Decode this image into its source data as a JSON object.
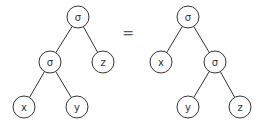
{
  "diagram": {
    "relation": "=",
    "left_tree": {
      "nodes": [
        {
          "id": "root",
          "label": "σ",
          "x": 78,
          "y": 17
        },
        {
          "id": "inner",
          "label": "σ",
          "x": 50,
          "y": 62
        },
        {
          "id": "z",
          "label": "z",
          "x": 103,
          "y": 62
        },
        {
          "id": "x",
          "label": "x",
          "x": 24,
          "y": 107
        },
        {
          "id": "y",
          "label": "y",
          "x": 77,
          "y": 107
        }
      ],
      "edges": [
        [
          "root",
          "inner"
        ],
        [
          "root",
          "z"
        ],
        [
          "inner",
          "x"
        ],
        [
          "inner",
          "y"
        ]
      ]
    },
    "right_tree": {
      "nodes": [
        {
          "id": "root",
          "label": "σ",
          "x": 188,
          "y": 17
        },
        {
          "id": "x",
          "label": "x",
          "x": 161,
          "y": 62
        },
        {
          "id": "inner",
          "label": "σ",
          "x": 215,
          "y": 62
        },
        {
          "id": "y",
          "label": "y",
          "x": 188,
          "y": 107
        },
        {
          "id": "z",
          "label": "z",
          "x": 240,
          "y": 107
        }
      ],
      "edges": [
        [
          "root",
          "x"
        ],
        [
          "root",
          "inner"
        ],
        [
          "inner",
          "y"
        ],
        [
          "inner",
          "z"
        ]
      ]
    }
  }
}
